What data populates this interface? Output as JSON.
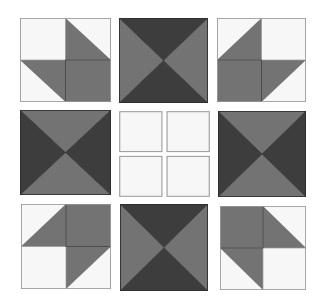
{
  "colors": {
    "background": "#ffffff",
    "light": "#f7f7f7",
    "medium": "#737373",
    "dark": "#3d3d3d",
    "outline": "#9a9a9a",
    "seam": "#2e2e2e"
  },
  "quilt": {
    "rows": 3,
    "cols": 3,
    "blocks": [
      {
        "row": 0,
        "col": 0,
        "type": "hst-corner",
        "orientation": "bottom-right",
        "x": 20,
        "y": 18,
        "w": 91,
        "h": 84
      },
      {
        "row": 0,
        "col": 1,
        "type": "hourglass",
        "orientation": "dark-top-bottom",
        "x": 119,
        "y": 18,
        "w": 89,
        "h": 85
      },
      {
        "row": 0,
        "col": 2,
        "type": "hst-corner",
        "orientation": "bottom-left",
        "x": 217,
        "y": 18,
        "w": 89,
        "h": 84
      },
      {
        "row": 1,
        "col": 0,
        "type": "hourglass",
        "orientation": "dark-left-right",
        "x": 20,
        "y": 110,
        "w": 91,
        "h": 85
      },
      {
        "row": 1,
        "col": 1,
        "type": "four-patch-plain",
        "orientation": "none",
        "x": 119,
        "y": 111,
        "w": 91,
        "h": 86
      },
      {
        "row": 1,
        "col": 2,
        "type": "hourglass",
        "orientation": "dark-left-right",
        "x": 218,
        "y": 111,
        "w": 88,
        "h": 86
      },
      {
        "row": 2,
        "col": 0,
        "type": "hst-corner",
        "orientation": "top-right",
        "x": 21,
        "y": 204,
        "w": 90,
        "h": 85
      },
      {
        "row": 2,
        "col": 1,
        "type": "hourglass",
        "orientation": "dark-top-bottom",
        "x": 120,
        "y": 204,
        "w": 88,
        "h": 87
      },
      {
        "row": 2,
        "col": 2,
        "type": "hst-corner",
        "orientation": "top-left",
        "x": 220,
        "y": 206,
        "w": 86,
        "h": 84
      }
    ]
  }
}
